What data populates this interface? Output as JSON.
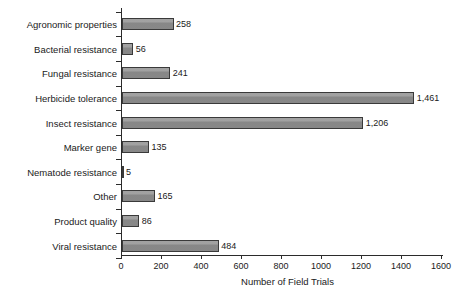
{
  "chart_data": {
    "type": "bar",
    "orientation": "horizontal",
    "title": "",
    "xlabel": "Number of Field Trials",
    "ylabel": "",
    "categories": [
      "Agronomic properties",
      "Bacterial resistance",
      "Fungal resistance",
      "Herbicide tolerance",
      "Insect resistance",
      "Marker gene",
      "Nematode resistance",
      "Other",
      "Product quality",
      "Viral resistance"
    ],
    "values": [
      258,
      56,
      241,
      1461,
      1206,
      135,
      5,
      165,
      86,
      484
    ],
    "value_labels": [
      "258",
      "56",
      "241",
      "1,461",
      "1,206",
      "135",
      "5",
      "165",
      "86",
      "484"
    ],
    "xlim": [
      0,
      1600
    ],
    "xticks": [
      0,
      200,
      400,
      600,
      800,
      1000,
      1200,
      1400,
      1600
    ],
    "xtick_labels": [
      "0",
      "200",
      "400",
      "600",
      "800",
      "1000",
      "1200",
      "1400",
      "1600"
    ],
    "grid": false,
    "legend": null,
    "bar_color": "#8d8d8d",
    "bar_edge_color": "#3a3a3a",
    "axis_color": "#2b2b2b",
    "background_color": "#ffffff"
  }
}
